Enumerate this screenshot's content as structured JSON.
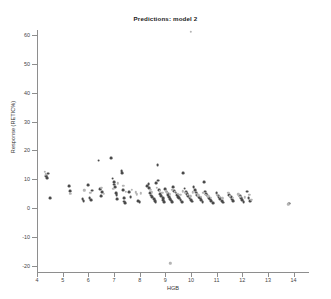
{
  "chart_data": {
    "type": "scatter",
    "title": "Predictions: model 2",
    "xlabel": "HGB",
    "ylabel": "Response (RETIC%)",
    "xlim": [
      4,
      14.6
    ],
    "ylim": [
      -22,
      63
    ],
    "xticks": [
      4,
      5,
      6,
      7,
      8,
      9,
      10,
      11,
      12,
      13,
      14
    ],
    "yticks": [
      -20,
      -10,
      0,
      10,
      20,
      30,
      40,
      50,
      60
    ],
    "grid": false,
    "legend": "none",
    "marker_colors": {
      "dark": "#4a4a4a",
      "light": "#b4b4b4"
    },
    "series": [
      {
        "name": "observed",
        "color": "dark",
        "points": [
          [
            4.35,
            11.2
          ],
          [
            4.38,
            10.4
          ],
          [
            4.42,
            12.0
          ],
          [
            4.5,
            3.6
          ],
          [
            5.25,
            7.6
          ],
          [
            5.3,
            6.0
          ],
          [
            5.78,
            3.3
          ],
          [
            5.82,
            2.6
          ],
          [
            6.0,
            7.9
          ],
          [
            6.05,
            3.5
          ],
          [
            6.1,
            2.9
          ],
          [
            6.15,
            6.1
          ],
          [
            6.4,
            16.5
          ],
          [
            6.45,
            6.6
          ],
          [
            6.5,
            4.3
          ],
          [
            6.55,
            5.6
          ],
          [
            6.9,
            17.3
          ],
          [
            6.95,
            10.3
          ],
          [
            7.0,
            9.0
          ],
          [
            7.02,
            8.2
          ],
          [
            7.05,
            7.2
          ],
          [
            7.08,
            5.2
          ],
          [
            7.1,
            4.6
          ],
          [
            7.12,
            3.1
          ],
          [
            7.3,
            13.0
          ],
          [
            7.32,
            12.2
          ],
          [
            7.35,
            6.4
          ],
          [
            7.38,
            3.6
          ],
          [
            7.4,
            2.3
          ],
          [
            7.42,
            1.9
          ],
          [
            7.6,
            5.5
          ],
          [
            7.65,
            4.0
          ],
          [
            7.95,
            2.5
          ],
          [
            8.0,
            2.1
          ],
          [
            8.3,
            7.6
          ],
          [
            8.35,
            8.4
          ],
          [
            8.38,
            6.9
          ],
          [
            8.4,
            5.2
          ],
          [
            8.45,
            4.4
          ],
          [
            8.5,
            3.8
          ],
          [
            8.55,
            3.2
          ],
          [
            8.6,
            2.6
          ],
          [
            8.62,
            2.0
          ],
          [
            8.65,
            8.8
          ],
          [
            8.7,
            15.0
          ],
          [
            8.72,
            9.6
          ],
          [
            8.75,
            6.2
          ],
          [
            8.8,
            5.0
          ],
          [
            8.85,
            4.2
          ],
          [
            8.9,
            3.5
          ],
          [
            8.92,
            2.8
          ],
          [
            8.95,
            2.2
          ],
          [
            9.0,
            6.6
          ],
          [
            9.05,
            5.8
          ],
          [
            9.1,
            5.0
          ],
          [
            9.12,
            4.4
          ],
          [
            9.15,
            3.9
          ],
          [
            9.2,
            3.3
          ],
          [
            9.22,
            2.7
          ],
          [
            9.25,
            2.1
          ],
          [
            9.3,
            7.2
          ],
          [
            9.35,
            6.0
          ],
          [
            9.4,
            5.4
          ],
          [
            9.45,
            4.7
          ],
          [
            9.5,
            4.0
          ],
          [
            9.55,
            3.4
          ],
          [
            9.6,
            2.8
          ],
          [
            9.65,
            2.2
          ],
          [
            9.7,
            12.3
          ],
          [
            9.75,
            6.8
          ],
          [
            9.8,
            5.6
          ],
          [
            9.85,
            4.8
          ],
          [
            9.9,
            4.1
          ],
          [
            9.95,
            3.5
          ],
          [
            10.0,
            2.9
          ],
          [
            10.05,
            2.3
          ],
          [
            10.1,
            7.4
          ],
          [
            10.15,
            6.2
          ],
          [
            10.2,
            5.4
          ],
          [
            10.25,
            4.6
          ],
          [
            10.3,
            4.0
          ],
          [
            10.35,
            3.4
          ],
          [
            10.4,
            2.8
          ],
          [
            10.45,
            2.2
          ],
          [
            10.5,
            9.0
          ],
          [
            10.55,
            5.8
          ],
          [
            10.6,
            4.9
          ],
          [
            10.65,
            4.2
          ],
          [
            10.7,
            3.6
          ],
          [
            10.75,
            3.0
          ],
          [
            10.8,
            2.4
          ],
          [
            10.85,
            1.9
          ],
          [
            11.0,
            5.2
          ],
          [
            11.05,
            4.4
          ],
          [
            11.1,
            3.7
          ],
          [
            11.15,
            3.1
          ],
          [
            11.2,
            2.5
          ],
          [
            11.25,
            2.0
          ],
          [
            11.5,
            4.6
          ],
          [
            11.55,
            3.8
          ],
          [
            11.6,
            3.0
          ],
          [
            11.65,
            2.4
          ],
          [
            11.9,
            4.2
          ],
          [
            11.95,
            3.4
          ],
          [
            12.0,
            2.8
          ],
          [
            12.05,
            2.2
          ],
          [
            12.2,
            5.8
          ],
          [
            12.25,
            3.6
          ],
          [
            12.3,
            2.6
          ],
          [
            13.82,
            1.6
          ]
        ]
      },
      {
        "name": "predicted",
        "color": "light",
        "points": [
          [
            4.3,
            12.6
          ],
          [
            4.34,
            11.8
          ],
          [
            5.3,
            5.0
          ],
          [
            5.85,
            6.2
          ],
          [
            6.08,
            5.3
          ],
          [
            6.5,
            7.0
          ],
          [
            6.6,
            5.0
          ],
          [
            6.98,
            6.8
          ],
          [
            7.15,
            8.6
          ],
          [
            7.36,
            7.8
          ],
          [
            7.45,
            5.8
          ],
          [
            7.7,
            6.4
          ],
          [
            7.85,
            5.6
          ],
          [
            7.9,
            4.8
          ],
          [
            8.05,
            5.2
          ],
          [
            8.42,
            6.4
          ],
          [
            8.48,
            5.6
          ],
          [
            8.68,
            7.0
          ],
          [
            8.78,
            6.0
          ],
          [
            8.88,
            5.4
          ],
          [
            9.02,
            5.9
          ],
          [
            9.08,
            5.3
          ],
          [
            9.18,
            4.8
          ],
          [
            9.28,
            6.4
          ],
          [
            9.38,
            5.7
          ],
          [
            9.48,
            5.1
          ],
          [
            9.58,
            4.6
          ],
          [
            9.68,
            5.9
          ],
          [
            9.78,
            5.3
          ],
          [
            9.88,
            4.7
          ],
          [
            9.98,
            4.2
          ],
          [
            10.08,
            5.6
          ],
          [
            10.18,
            5.0
          ],
          [
            10.28,
            4.5
          ],
          [
            10.38,
            4.0
          ],
          [
            10.48,
            5.3
          ],
          [
            10.58,
            4.7
          ],
          [
            10.68,
            4.2
          ],
          [
            10.78,
            3.7
          ],
          [
            11.02,
            4.6
          ],
          [
            11.12,
            4.0
          ],
          [
            11.22,
            3.5
          ],
          [
            11.45,
            5.4
          ],
          [
            11.52,
            4.2
          ],
          [
            11.62,
            3.6
          ],
          [
            11.85,
            4.8
          ],
          [
            11.92,
            4.0
          ],
          [
            12.1,
            3.8
          ],
          [
            12.28,
            4.6
          ],
          [
            12.35,
            3.0
          ],
          [
            13.8,
            1.4
          ],
          [
            10.0,
            61.0
          ],
          [
            9.2,
            -19.0
          ]
        ]
      }
    ]
  }
}
